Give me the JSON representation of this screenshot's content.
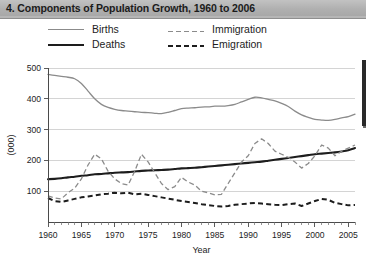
{
  "title": "4. Components of Population Growth, 1960 to 2006",
  "legend": {
    "position": "top-left",
    "entries": [
      {
        "label": "Births",
        "style": "solid-light",
        "color": "#8b8b8b"
      },
      {
        "label": "Deaths",
        "style": "solid-bold",
        "color": "#1d1d1d"
      },
      {
        "label": "Immigration",
        "style": "dash-light",
        "color": "#8b8b8b"
      },
      {
        "label": "Emigration",
        "style": "dash-bold",
        "color": "#1d1d1d"
      }
    ]
  },
  "axes": {
    "y_label": "(000)",
    "x_label": "Year",
    "y_ticks": [
      "100",
      "200",
      "300",
      "400",
      "500"
    ],
    "x_ticks": [
      "1960",
      "1965",
      "1970",
      "1975",
      "1980",
      "1985",
      "1990",
      "1995",
      "2000",
      "2005"
    ]
  },
  "chart_data": {
    "type": "line",
    "title": "4. Components of Population Growth, 1960 to 2006",
    "xlabel": "Year",
    "ylabel": "(000)",
    "xlim": [
      1960,
      2006
    ],
    "ylim": [
      0,
      500
    ],
    "ytick_values": [
      100,
      200,
      300,
      400,
      500
    ],
    "xtick_values": [
      1960,
      1965,
      1970,
      1975,
      1980,
      1985,
      1990,
      1995,
      2000,
      2005
    ],
    "minor_xticks": "every year",
    "grid": "horizontal",
    "legend_position": "above plot, two columns",
    "units": "thousands",
    "x": [
      1960,
      1961,
      1962,
      1963,
      1964,
      1965,
      1966,
      1967,
      1968,
      1969,
      1970,
      1971,
      1972,
      1973,
      1974,
      1975,
      1976,
      1977,
      1978,
      1979,
      1980,
      1981,
      1982,
      1983,
      1984,
      1985,
      1986,
      1987,
      1988,
      1989,
      1990,
      1991,
      1992,
      1993,
      1994,
      1995,
      1996,
      1997,
      1998,
      1999,
      2000,
      2001,
      2002,
      2003,
      2004,
      2005,
      2006
    ],
    "series": [
      {
        "name": "Births",
        "style": "solid-light",
        "color": "#8b8b8b",
        "values": [
          479,
          476,
          473,
          470,
          465,
          450,
          425,
          400,
          382,
          372,
          366,
          362,
          360,
          358,
          356,
          355,
          353,
          352,
          356,
          362,
          368,
          370,
          371,
          373,
          374,
          376,
          376,
          378,
          382,
          390,
          398,
          405,
          403,
          398,
          393,
          385,
          375,
          360,
          348,
          340,
          333,
          331,
          330,
          333,
          338,
          342,
          350
        ]
      },
      {
        "name": "Deaths",
        "style": "solid-bold",
        "color": "#1d1d1d",
        "values": [
          139,
          140,
          142,
          145,
          147,
          150,
          152,
          155,
          156,
          158,
          160,
          161,
          162,
          164,
          166,
          167,
          168,
          169,
          170,
          172,
          174,
          175,
          176,
          178,
          180,
          182,
          184,
          186,
          188,
          190,
          192,
          194,
          196,
          199,
          202,
          205,
          208,
          211,
          214,
          217,
          220,
          222,
          224,
          226,
          229,
          233,
          240
        ]
      },
      {
        "name": "Immigration",
        "style": "dash-light",
        "color": "#8b8b8b",
        "values": [
          85,
          78,
          75,
          95,
          110,
          140,
          185,
          220,
          205,
          165,
          140,
          125,
          120,
          165,
          220,
          195,
          160,
          125,
          105,
          115,
          145,
          130,
          120,
          100,
          95,
          88,
          90,
          125,
          160,
          195,
          215,
          255,
          270,
          255,
          230,
          220,
          210,
          195,
          175,
          190,
          215,
          250,
          240,
          215,
          230,
          240,
          250
        ]
      },
      {
        "name": "Emigration",
        "style": "dash-bold",
        "color": "#1d1d1d",
        "values": [
          78,
          68,
          65,
          70,
          75,
          80,
          83,
          86,
          90,
          92,
          95,
          93,
          95,
          90,
          92,
          88,
          84,
          80,
          76,
          72,
          68,
          65,
          62,
          58,
          55,
          52,
          50,
          52,
          56,
          58,
          60,
          62,
          60,
          58,
          56,
          55,
          58,
          60,
          52,
          60,
          68,
          75,
          72,
          62,
          58,
          54,
          55
        ]
      }
    ]
  }
}
